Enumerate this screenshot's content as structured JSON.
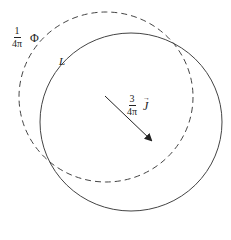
{
  "diagram": {
    "type": "two overlapping closed curves with vector arrow",
    "colors": {
      "stroke": "#333333",
      "background": "#ffffff"
    },
    "dashed_curve": {
      "style": "dashed",
      "label": {
        "fraction_numerator": "1",
        "fraction_denominator": "4π",
        "symbol": "Φ"
      }
    },
    "solid_curve": {
      "style": "solid",
      "label": {
        "symbol": "L"
      }
    },
    "arrow": {
      "direction": "down-right",
      "label": {
        "fraction_numerator": "3",
        "fraction_denominator": "4π",
        "symbol": "J",
        "vector_mark": "→"
      }
    }
  }
}
